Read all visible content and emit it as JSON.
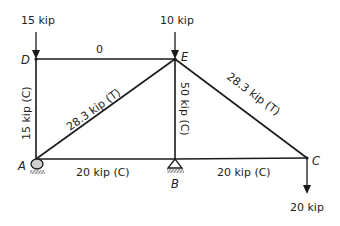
{
  "diagram": {
    "type": "truss",
    "nodes": {
      "A": {
        "label": "A",
        "x": 36,
        "y": 159,
        "support": "roller"
      },
      "B": {
        "label": "B",
        "x": 175,
        "y": 159,
        "support": "pin"
      },
      "C": {
        "label": "C",
        "x": 307,
        "y": 158
      },
      "D": {
        "label": "D",
        "x": 36,
        "y": 59
      },
      "E": {
        "label": "E",
        "x": 175,
        "y": 59
      }
    },
    "members": {
      "DE": {
        "from": "D",
        "to": "E",
        "force": "0"
      },
      "AD": {
        "from": "A",
        "to": "D",
        "force": "15 kip (C)"
      },
      "AE": {
        "from": "A",
        "to": "E",
        "force": "28.3 kip (T)"
      },
      "BE": {
        "from": "B",
        "to": "E",
        "force": "50 kip (C)"
      },
      "CE": {
        "from": "E",
        "to": "C",
        "force": "28.3 kip (T)"
      },
      "AB": {
        "from": "A",
        "to": "B",
        "force": "20 kip (C)"
      },
      "BC": {
        "from": "B",
        "to": "C",
        "force": "20 kip (C)"
      }
    },
    "loads": {
      "D": {
        "label": "15 kip",
        "direction": "down"
      },
      "E": {
        "label": "10 kip",
        "direction": "down"
      },
      "C": {
        "label": "20 kip",
        "direction": "down"
      }
    },
    "colors": {
      "line": "#1a1a1a",
      "text": "#222222",
      "support_fill": "#cfcfcf"
    }
  }
}
